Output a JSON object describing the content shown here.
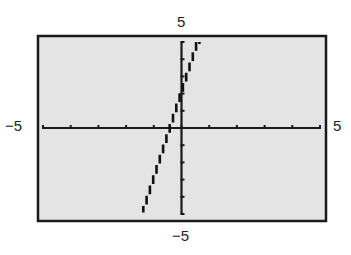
{
  "chart_data": {
    "type": "line",
    "title": "",
    "xlabel": "",
    "ylabel": "",
    "xlim": [
      -5,
      5
    ],
    "ylim": [
      -5,
      5
    ],
    "xscale": 1,
    "yscale": 1,
    "grid": false,
    "legend": null,
    "window_labels": {
      "xmin": "−5",
      "xmax": "5",
      "ymin": "−5",
      "ymax": "5"
    },
    "x_ticks": [
      -5,
      -4,
      -3,
      -2,
      -1,
      0,
      1,
      2,
      3,
      4,
      5
    ],
    "y_ticks": [
      -5,
      -4,
      -3,
      -2,
      -1,
      0,
      1,
      2,
      3,
      4,
      5
    ],
    "series": [
      {
        "name": "y = 5x + 2",
        "equation": {
          "slope": 5,
          "intercept": 2
        },
        "x": [
          -1.4,
          -1.0,
          -0.4,
          0.0,
          0.6
        ],
        "y": [
          -5,
          -3,
          0,
          2,
          5
        ],
        "style": "pixelated-stepped"
      }
    ],
    "colors": {
      "screen_background": "#e4e4e4",
      "frame": "#1a1a1a",
      "axes": "#1a1a1a",
      "line": "#111111"
    }
  }
}
